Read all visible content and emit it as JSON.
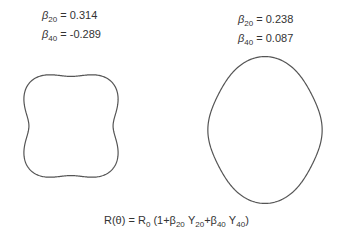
{
  "figure": {
    "left": {
      "beta20_symbol": "β",
      "beta20_sub": "20",
      "beta20_value": "= 0.314",
      "beta40_symbol": "β",
      "beta40_sub": "40",
      "beta40_value": "= -0.289",
      "beta20": 0.314,
      "beta40": -0.289,
      "center": [
        71,
        126
      ],
      "radius": 52
    },
    "right": {
      "beta20_symbol": "β",
      "beta20_sub": "20",
      "beta20_value": "= 0.238",
      "beta40_symbol": "β",
      "beta40_sub": "40",
      "beta40_value": "= 0.087",
      "beta20": 0.238,
      "beta40": 0.087,
      "center": [
        265,
        130
      ],
      "radius": 60
    },
    "formula": {
      "lhs": "R(θ) = R",
      "r0_sub": "0",
      "open": " (1+",
      "b20": "β",
      "b20_sub": "20",
      "y20": " Y",
      "y20_sub": "20",
      "plus": "+",
      "b40": "β",
      "b40_sub": "40",
      "y40": " Y",
      "y40_sub": "40",
      "close": ")"
    },
    "stroke_color": "#555555"
  }
}
